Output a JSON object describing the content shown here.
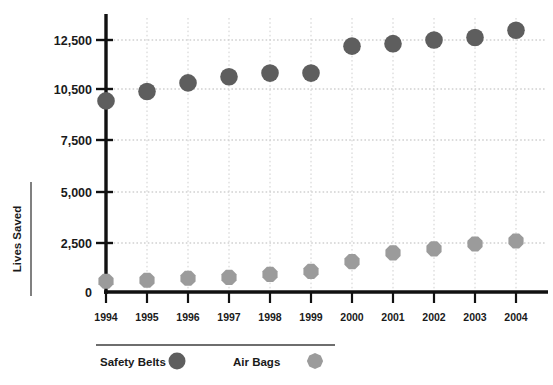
{
  "chart_data": {
    "type": "scatter",
    "title": "",
    "xlabel": "",
    "ylabel": "Lives Saved",
    "categories": [
      "1994",
      "1995",
      "1996",
      "1997",
      "1998",
      "1999",
      "2000",
      "2001",
      "2002",
      "2003",
      "2004"
    ],
    "ytick_labels": [
      "0",
      "2,500",
      "5,000",
      "7,500",
      "10,500",
      "12,500"
    ],
    "ytick_values": [
      0,
      2500,
      5000,
      7500,
      10500,
      12500
    ],
    "ylim": [
      0,
      13200
    ],
    "grid": true,
    "legend_position": "bottom",
    "series": [
      {
        "name": "Safety Belts",
        "marker": "circle",
        "color": "#5e5e5e",
        "values": [
          9800,
          10350,
          10750,
          11000,
          11150,
          11150,
          12250,
          12350,
          12500,
          12600,
          12900
        ]
      },
      {
        "name": "Air Bags",
        "marker": "octagon",
        "color": "#9b9b9b",
        "values": [
          550,
          600,
          700,
          750,
          900,
          1050,
          1550,
          2000,
          2200,
          2450,
          2600
        ]
      }
    ]
  },
  "axes": {
    "y_title": "Lives Saved",
    "y_labels": [
      "12,500",
      "10,500",
      "7,500",
      "5,000",
      "2,500",
      "0"
    ],
    "x_labels": [
      "1994",
      "1995",
      "1996",
      "1997",
      "1998",
      "1999",
      "2000",
      "2001",
      "2002",
      "2003",
      "2004"
    ]
  },
  "legend": {
    "entries": [
      {
        "label": "Safety Belts",
        "marker": "circle-marker-icon",
        "color": "#5e5e5e"
      },
      {
        "label": "Air Bags",
        "marker": "octagon-marker-icon",
        "color": "#9b9b9b"
      }
    ]
  },
  "colors": {
    "safety_belts": "#5e5e5e",
    "air_bags": "#9b9b9b",
    "axis": "#111111",
    "grid": "#b9b9b9",
    "background": "#ffffff"
  }
}
